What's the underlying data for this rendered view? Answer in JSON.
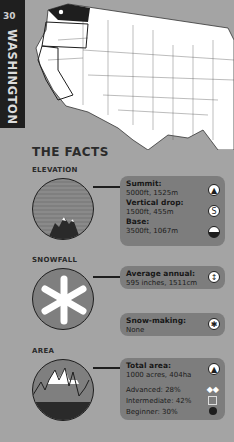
{
  "page": {
    "number": "30",
    "state": "WASHINGTON"
  },
  "map": {
    "highlighted_state": "Washington",
    "marker": "resort-location-dot"
  },
  "facts": {
    "title": "THE FACTS",
    "elevation": {
      "heading": "ELEVATION",
      "summit_label": "Summit:",
      "summit_value": "5000ft, 1525m",
      "drop_label": "Vertical drop:",
      "drop_value": "1500ft, 455m",
      "base_label": "Base:",
      "base_value": "3500ft, 1067m"
    },
    "snowfall": {
      "heading": "SNOWFALL",
      "annual_label": "Average annual:",
      "annual_value": "595 inches, 1511cm",
      "snowmaking_label": "Snow-making:",
      "snowmaking_value": "None"
    },
    "area": {
      "heading": "AREA",
      "total_label": "Total area:",
      "total_value": "1000 acres, 404ha",
      "advanced": "Advanced: 28%",
      "intermediate": "Intermediate: 42%",
      "beginner": "Beginner: 30%"
    }
  },
  "colors": {
    "background": "#a4a4a4",
    "panel": "#7d7d7d",
    "tab": "#1f1f1f"
  }
}
